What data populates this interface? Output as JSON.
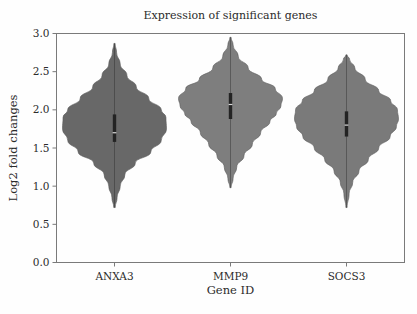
{
  "chart_data": {
    "type": "violin",
    "title": "Expression of significant genes",
    "xlabel": "Gene ID",
    "ylabel": "Log2 fold changes",
    "categories": [
      "ANXA3",
      "MMP9",
      "SOCS3"
    ],
    "ylim": [
      0.0,
      3.0
    ],
    "yticks": [
      "0.0",
      "0.5",
      "1.0",
      "1.5",
      "2.0",
      "2.5",
      "3.0"
    ],
    "ytick_values": [
      0.0,
      0.5,
      1.0,
      1.5,
      2.0,
      2.5,
      3.0
    ],
    "grid": false,
    "legend": "none",
    "frame": "box",
    "series": [
      {
        "name": "ANXA3",
        "color": "#686868",
        "min": 0.72,
        "max": 2.87,
        "q1": 1.58,
        "median": 1.7,
        "q3": 1.94,
        "peak": 1.8,
        "density": [
          {
            "y": 0.72,
            "w": 0.015
          },
          {
            "y": 0.85,
            "w": 0.05
          },
          {
            "y": 1.0,
            "w": 0.11
          },
          {
            "y": 1.15,
            "w": 0.2
          },
          {
            "y": 1.3,
            "w": 0.4
          },
          {
            "y": 1.45,
            "w": 0.7
          },
          {
            "y": 1.6,
            "w": 0.9
          },
          {
            "y": 1.75,
            "w": 1.0
          },
          {
            "y": 1.9,
            "w": 0.99
          },
          {
            "y": 2.0,
            "w": 0.9
          },
          {
            "y": 2.15,
            "w": 0.66
          },
          {
            "y": 2.3,
            "w": 0.42
          },
          {
            "y": 2.45,
            "w": 0.24
          },
          {
            "y": 2.6,
            "w": 0.11
          },
          {
            "y": 2.75,
            "w": 0.04
          },
          {
            "y": 2.87,
            "w": 0.012
          }
        ]
      },
      {
        "name": "MMP9",
        "color": "#7e7e7e",
        "min": 0.98,
        "max": 2.95,
        "q1": 1.88,
        "median": 2.07,
        "q3": 2.22,
        "peak": 2.13,
        "density": [
          {
            "y": 0.98,
            "w": 0.012
          },
          {
            "y": 1.1,
            "w": 0.05
          },
          {
            "y": 1.25,
            "w": 0.12
          },
          {
            "y": 1.4,
            "w": 0.26
          },
          {
            "y": 1.55,
            "w": 0.42
          },
          {
            "y": 1.7,
            "w": 0.58
          },
          {
            "y": 1.85,
            "w": 0.76
          },
          {
            "y": 1.95,
            "w": 0.88
          },
          {
            "y": 2.05,
            "w": 0.97
          },
          {
            "y": 2.15,
            "w": 1.0
          },
          {
            "y": 2.28,
            "w": 0.86
          },
          {
            "y": 2.4,
            "w": 0.6
          },
          {
            "y": 2.55,
            "w": 0.34
          },
          {
            "y": 2.7,
            "w": 0.15
          },
          {
            "y": 2.85,
            "w": 0.05
          },
          {
            "y": 2.95,
            "w": 0.012
          }
        ]
      },
      {
        "name": "SOCS3",
        "color": "#7a7a7a",
        "min": 0.72,
        "max": 2.72,
        "q1": 1.65,
        "median": 1.8,
        "q3": 1.98,
        "peak": 1.85,
        "density": [
          {
            "y": 0.72,
            "w": 0.012
          },
          {
            "y": 0.9,
            "w": 0.05
          },
          {
            "y": 1.05,
            "w": 0.12
          },
          {
            "y": 1.2,
            "w": 0.24
          },
          {
            "y": 1.35,
            "w": 0.42
          },
          {
            "y": 1.5,
            "w": 0.62
          },
          {
            "y": 1.65,
            "w": 0.84
          },
          {
            "y": 1.78,
            "w": 0.96
          },
          {
            "y": 1.88,
            "w": 1.0
          },
          {
            "y": 2.0,
            "w": 0.98
          },
          {
            "y": 2.12,
            "w": 0.85
          },
          {
            "y": 2.25,
            "w": 0.62
          },
          {
            "y": 2.4,
            "w": 0.36
          },
          {
            "y": 2.55,
            "w": 0.16
          },
          {
            "y": 2.66,
            "w": 0.06
          },
          {
            "y": 2.72,
            "w": 0.012
          }
        ]
      }
    ]
  },
  "colors": {
    "axis": "#7a7a7a",
    "text": "#2b2b2b",
    "background": "#fefefe",
    "box": "#232323"
  }
}
